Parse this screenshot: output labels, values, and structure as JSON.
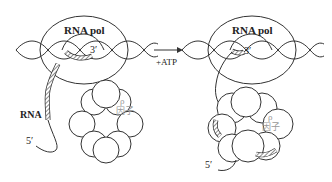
{
  "diagram": {
    "left_panel": {
      "polymerase_label": "RNA pol",
      "rna_3prime_label": "3′",
      "rna_label": "RNA",
      "rna_5prime_label": "5′",
      "rho_label_line1": "ρ",
      "rho_label_line2": "因子"
    },
    "arrow": {
      "label": "+ATP"
    },
    "right_panel": {
      "polymerase_label": "RNA pol",
      "rna_3prime_label": "3′",
      "rna_5prime_label": "5′",
      "rho_label_line1": "ρ",
      "rho_label_line2": "因子"
    },
    "colors": {
      "line": "#333333",
      "rho_text": "#999999",
      "background": "#ffffff"
    }
  }
}
